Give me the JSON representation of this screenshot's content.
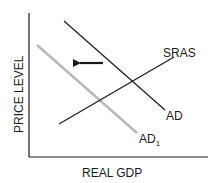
{
  "diagram": {
    "type": "economics-ad-as",
    "x_axis_label": "REAL GDP",
    "y_axis_label": "PRICE LEVEL",
    "curves": [
      {
        "name": "SRAS",
        "label": "SRAS",
        "color": "#1a1a1a",
        "from": [
          59,
          124
        ],
        "to": [
          174,
          57
        ]
      },
      {
        "name": "AD",
        "label": "AD",
        "color": "#1a1a1a",
        "from": [
          64,
          21
        ],
        "to": [
          165,
          110
        ]
      },
      {
        "name": "AD1",
        "label": "AD",
        "subscript": "1",
        "color": "#b8b8b8",
        "from": [
          37,
          45
        ],
        "to": [
          137,
          133
        ]
      }
    ],
    "shift_arrow": {
      "direction": "left",
      "color": "#1a1a1a"
    }
  }
}
